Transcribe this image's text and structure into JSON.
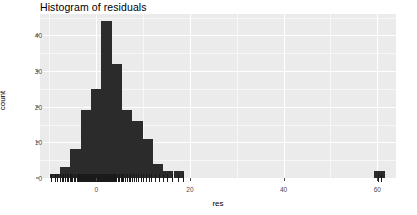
{
  "chart_data": {
    "type": "bar",
    "title": "Histogram of residuals",
    "xlabel": "res",
    "ylabel": "count",
    "xlim": [
      -12,
      64
    ],
    "ylim": [
      0,
      46
    ],
    "x_ticks": [
      0,
      20,
      40,
      60
    ],
    "x_tick_labels": [
      "0",
      "20",
      "40",
      "60"
    ],
    "y_ticks": [
      0,
      10,
      20,
      30,
      40
    ],
    "y_tick_labels": [
      "0",
      "10",
      "20",
      "30",
      "40"
    ],
    "grid": true,
    "grid_color": "#ffffff",
    "panel_color": "#ebebeb",
    "bar_color": "#2b2b2b",
    "bin_width": 2.2,
    "legend": null,
    "rug": true,
    "bins": [
      {
        "x_left": -9.9,
        "x_right": -7.7,
        "center": -8.8,
        "count": 1
      },
      {
        "x_left": -7.7,
        "x_right": -5.5,
        "center": -6.6,
        "count": 3
      },
      {
        "x_left": -5.5,
        "x_right": -3.3,
        "center": -4.4,
        "count": 8
      },
      {
        "x_left": -3.3,
        "x_right": -1.1,
        "center": -2.2,
        "count": 19
      },
      {
        "x_left": -1.1,
        "x_right": 1.1,
        "center": 0.0,
        "count": 25
      },
      {
        "x_left": 1.1,
        "x_right": 3.3,
        "center": 2.2,
        "count": 44
      },
      {
        "x_left": 3.3,
        "x_right": 5.5,
        "center": 4.4,
        "count": 32
      },
      {
        "x_left": 5.5,
        "x_right": 7.7,
        "center": 6.6,
        "count": 19
      },
      {
        "x_left": 7.7,
        "x_right": 9.9,
        "center": 8.8,
        "count": 16
      },
      {
        "x_left": 9.9,
        "x_right": 12.1,
        "center": 11.0,
        "count": 11
      },
      {
        "x_left": 12.1,
        "x_right": 14.3,
        "center": 13.2,
        "count": 4
      },
      {
        "x_left": 14.3,
        "x_right": 16.5,
        "center": 15.4,
        "count": 2
      },
      {
        "x_left": 16.5,
        "x_right": 18.7,
        "center": 17.6,
        "count": 2
      },
      {
        "x_left": 59.4,
        "x_right": 61.6,
        "center": 60.5,
        "count": 2
      }
    ],
    "rug_values": [
      -9.6,
      -8.9,
      -8.3,
      -7.8,
      -7.4,
      -7.0,
      -6.6,
      -6.3,
      -6.0,
      -5.7,
      -5.4,
      -5.1,
      -4.8,
      -4.5,
      -4.2,
      -4.0,
      -3.8,
      -3.6,
      -3.4,
      -3.2,
      -3.0,
      -2.8,
      -2.6,
      -2.4,
      -2.2,
      -2.0,
      -1.8,
      -1.6,
      -1.4,
      -1.2,
      -1.0,
      -0.8,
      -0.6,
      -0.4,
      -0.2,
      0.0,
      0.2,
      0.4,
      0.6,
      0.8,
      1.0,
      1.2,
      1.4,
      1.6,
      1.8,
      2.0,
      2.2,
      2.4,
      2.6,
      2.8,
      3.0,
      3.2,
      3.4,
      3.6,
      3.8,
      4.0,
      4.3,
      4.6,
      4.9,
      5.2,
      5.5,
      5.8,
      6.1,
      6.5,
      6.9,
      7.3,
      7.7,
      8.1,
      8.5,
      9.0,
      9.5,
      10.0,
      10.6,
      11.2,
      11.8,
      12.5,
      13.3,
      14.2,
      15.1,
      16.2,
      17.4,
      18.6,
      60.2,
      60.8
    ]
  }
}
